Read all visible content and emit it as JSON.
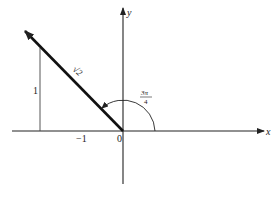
{
  "diagram": {
    "type": "vector-on-cartesian-plane",
    "axes": {
      "x_label": "x",
      "y_label": "y",
      "origin_label": "0"
    },
    "ticks": {
      "x_tick_label": "−1",
      "y_tick_label": "1"
    },
    "vector": {
      "magnitude_label": "√2",
      "tip": [
        -1,
        1
      ],
      "angle_rad": "3π/4"
    },
    "angle_arc": {
      "numerator": "3π",
      "denominator": "4"
    },
    "colors": {
      "line": "#222222",
      "background": "#ffffff"
    }
  }
}
